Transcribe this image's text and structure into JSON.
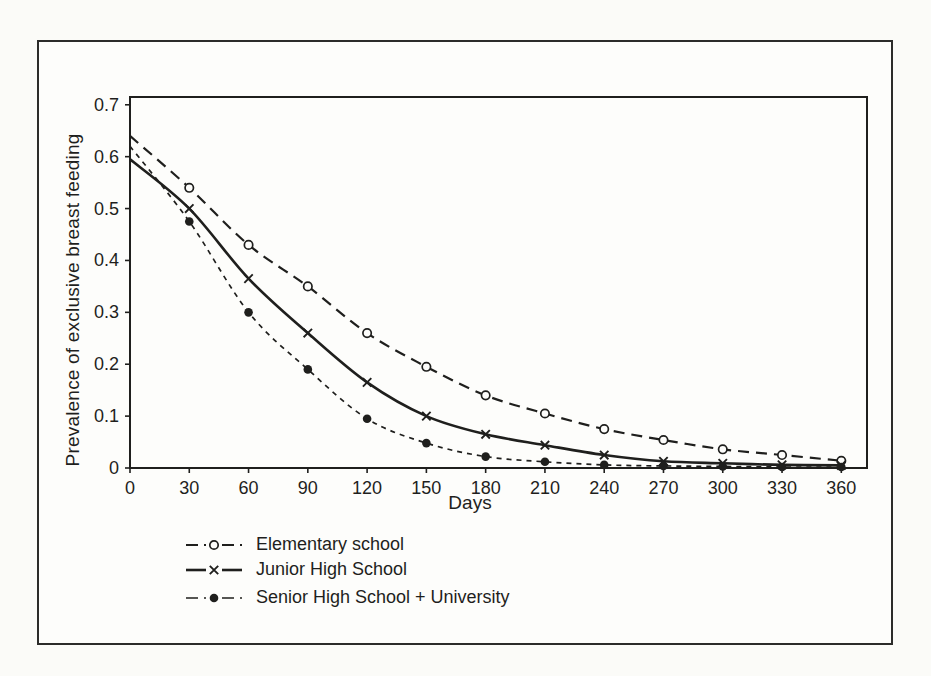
{
  "figure": {
    "background": "#fbfbf8",
    "frame_border_color": "#2c2c2a",
    "ink_color": "#1f1f1d"
  },
  "chart_data": {
    "type": "line",
    "title": "",
    "xlabel": "Days",
    "ylabel": "Prevalence of exclusive breast feeding",
    "xlim": [
      0,
      373
    ],
    "ylim": [
      0,
      0.715
    ],
    "grid": false,
    "legend_position": "below-left",
    "x_ticks": [
      0,
      30,
      60,
      90,
      120,
      150,
      180,
      210,
      240,
      270,
      300,
      330,
      360
    ],
    "y_ticks": [
      0,
      0.1,
      0.2,
      0.3,
      0.4,
      0.5,
      0.6,
      0.7
    ],
    "y_tick_labels": [
      "0",
      "0.1",
      "0.2",
      "0.3",
      "0.4",
      "0.5",
      "0.6",
      "0.7"
    ],
    "x": [
      0,
      30,
      60,
      90,
      120,
      150,
      180,
      210,
      240,
      270,
      300,
      330,
      360
    ],
    "series": [
      {
        "name": "Elementary school",
        "marker": "circle-open",
        "line": "dashed-long",
        "values": [
          0.64,
          0.54,
          0.43,
          0.35,
          0.26,
          0.195,
          0.14,
          0.105,
          0.075,
          0.054,
          0.036,
          0.025,
          0.014
        ]
      },
      {
        "name": "Junior High School",
        "marker": "x",
        "line": "solid",
        "values": [
          0.595,
          0.5,
          0.365,
          0.26,
          0.165,
          0.1,
          0.065,
          0.044,
          0.025,
          0.013,
          0.009,
          0.006,
          0.005
        ]
      },
      {
        "name": "Senior High School + University",
        "marker": "circle-filled",
        "line": "dashed-short",
        "values": [
          0.62,
          0.475,
          0.3,
          0.19,
          0.095,
          0.048,
          0.022,
          0.012,
          0.006,
          0.004,
          0.003,
          0.002,
          0.002
        ]
      }
    ]
  }
}
